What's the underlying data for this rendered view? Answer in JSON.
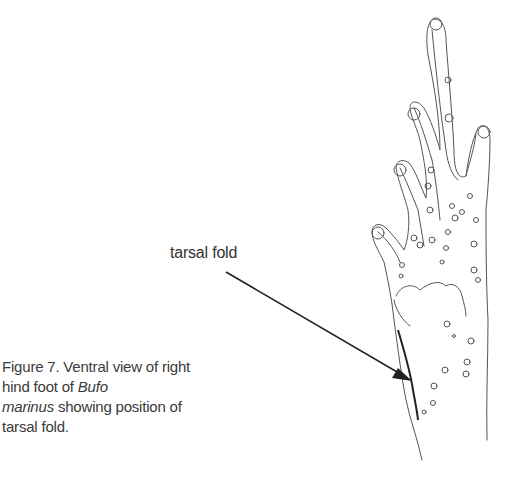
{
  "figure": {
    "label": "tarsal fold",
    "caption": {
      "prefix": "Figure 7. Ventral view of right hind foot of ",
      "genus": "Bufo",
      "species": "marinus",
      "suffix": " showing position of tarsal fold."
    },
    "illustration": "line drawing of toad hind foot (ventral view) with arrow pointing to tarsal fold",
    "colors": {
      "line": "#444444",
      "text": "#333333",
      "background": "#ffffff"
    }
  }
}
